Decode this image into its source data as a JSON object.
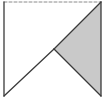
{
  "diagram": {
    "type": "geometric-figure",
    "colors": {
      "stroke": "#3a3a3a",
      "dashed_stroke": "#8a8a8a",
      "shade_fill": "#c9c9c9",
      "background": "#ffffff"
    },
    "points": {
      "top_left": [
        4,
        2
      ],
      "top_right": [
        101,
        2
      ],
      "bottom_left": [
        4,
        96
      ],
      "bottom_right": [
        101,
        96
      ],
      "mid": [
        54,
        49
      ]
    },
    "edges": [
      {
        "name": "top",
        "from": "top_left",
        "to": "top_right",
        "style": "dashed"
      },
      {
        "name": "left",
        "from": "top_left",
        "to": "bottom_left",
        "style": "solid"
      },
      {
        "name": "right",
        "from": "top_right",
        "to": "bottom_right",
        "style": "solid"
      },
      {
        "name": "diagonal-lower",
        "from": "bottom_left",
        "to": "mid",
        "style": "solid"
      },
      {
        "name": "diagonal-upper",
        "from": "mid",
        "to": "top_right",
        "style": "solid"
      },
      {
        "name": "mid-to-bottom-right",
        "from": "mid",
        "to": "bottom_right",
        "style": "solid"
      }
    ],
    "shaded_region": [
      "top_right",
      "mid",
      "bottom_right"
    ]
  }
}
